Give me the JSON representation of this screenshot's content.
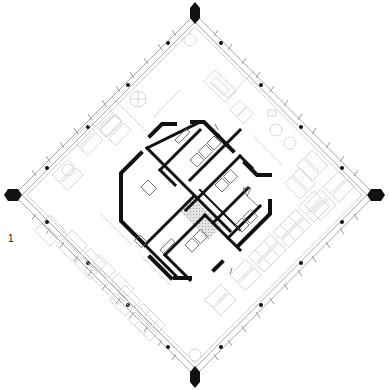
{
  "drawing": {
    "type": "architectural floor plan",
    "shape": "diamond",
    "floor_label": "1",
    "colors": {
      "background": "#ffffff",
      "core_walls": "#111111",
      "furniture": "#c8c8c8",
      "facade": "#a8a8a8",
      "columns": "#111111",
      "stair_hatch": "#cfcfcf"
    },
    "corners": {
      "top": [
        195,
        12
      ],
      "right": [
        377,
        195
      ],
      "bottom": [
        195,
        378
      ],
      "left": [
        12,
        195
      ]
    }
  }
}
